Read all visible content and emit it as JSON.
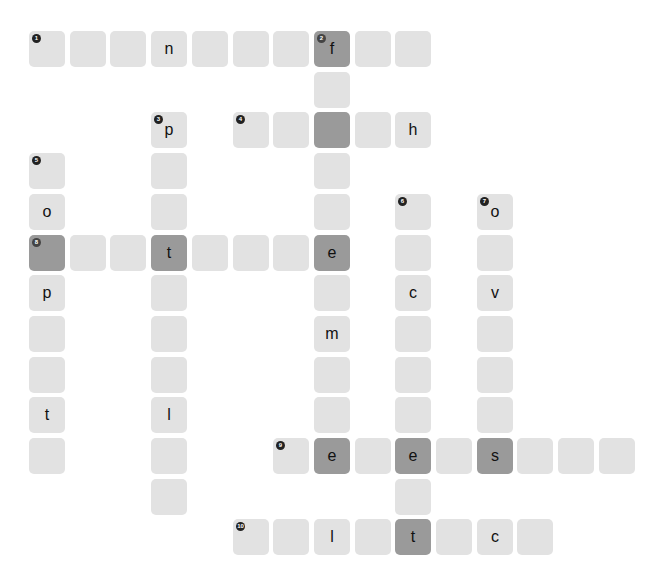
{
  "puzzle": {
    "colors": {
      "cell": "#e2e2e2",
      "highlight": "#9a9a9a",
      "number_badge": "#222222"
    },
    "grid": {
      "origin_x": 29,
      "origin_y": 31,
      "pitch": 40.7,
      "cell_size": 36
    },
    "cells": [
      {
        "r": 0,
        "c": 0,
        "num": "1",
        "letter": ""
      },
      {
        "r": 0,
        "c": 1,
        "letter": ""
      },
      {
        "r": 0,
        "c": 2,
        "letter": ""
      },
      {
        "r": 0,
        "c": 3,
        "letter": "n"
      },
      {
        "r": 0,
        "c": 4,
        "letter": ""
      },
      {
        "r": 0,
        "c": 5,
        "letter": ""
      },
      {
        "r": 0,
        "c": 6,
        "letter": ""
      },
      {
        "r": 0,
        "c": 7,
        "num": "2",
        "letter": "f",
        "dark": true
      },
      {
        "r": 0,
        "c": 8,
        "letter": ""
      },
      {
        "r": 0,
        "c": 9,
        "letter": ""
      },
      {
        "r": 1,
        "c": 7,
        "letter": ""
      },
      {
        "r": 2,
        "c": 7,
        "letter": "",
        "dark": true
      },
      {
        "r": 3,
        "c": 7,
        "letter": ""
      },
      {
        "r": 4,
        "c": 7,
        "letter": ""
      },
      {
        "r": 5,
        "c": 7,
        "letter": "e",
        "dark": true
      },
      {
        "r": 6,
        "c": 7,
        "letter": ""
      },
      {
        "r": 7,
        "c": 7,
        "letter": "m"
      },
      {
        "r": 8,
        "c": 7,
        "letter": ""
      },
      {
        "r": 9,
        "c": 7,
        "letter": ""
      },
      {
        "r": 10,
        "c": 7,
        "letter": "e",
        "dark": true
      },
      {
        "r": 2,
        "c": 5,
        "num": "4",
        "letter": ""
      },
      {
        "r": 2,
        "c": 6,
        "letter": ""
      },
      {
        "r": 2,
        "c": 8,
        "letter": ""
      },
      {
        "r": 2,
        "c": 9,
        "letter": "h"
      },
      {
        "r": 2,
        "c": 3,
        "num": "3",
        "letter": "p"
      },
      {
        "r": 3,
        "c": 3,
        "letter": ""
      },
      {
        "r": 4,
        "c": 3,
        "letter": ""
      },
      {
        "r": 5,
        "c": 3,
        "letter": "t",
        "dark": true
      },
      {
        "r": 6,
        "c": 3,
        "letter": ""
      },
      {
        "r": 7,
        "c": 3,
        "letter": ""
      },
      {
        "r": 8,
        "c": 3,
        "letter": ""
      },
      {
        "r": 9,
        "c": 3,
        "letter": "l"
      },
      {
        "r": 10,
        "c": 3,
        "letter": ""
      },
      {
        "r": 11,
        "c": 3,
        "letter": ""
      },
      {
        "r": 3,
        "c": 0,
        "num": "5",
        "letter": ""
      },
      {
        "r": 4,
        "c": 0,
        "letter": "o"
      },
      {
        "r": 5,
        "c": 0,
        "num": "8",
        "letter": "",
        "dark": true
      },
      {
        "r": 6,
        "c": 0,
        "letter": "p"
      },
      {
        "r": 7,
        "c": 0,
        "letter": ""
      },
      {
        "r": 8,
        "c": 0,
        "letter": ""
      },
      {
        "r": 9,
        "c": 0,
        "letter": "t"
      },
      {
        "r": 10,
        "c": 0,
        "letter": ""
      },
      {
        "r": 5,
        "c": 1,
        "letter": ""
      },
      {
        "r": 5,
        "c": 2,
        "letter": ""
      },
      {
        "r": 5,
        "c": 4,
        "letter": ""
      },
      {
        "r": 5,
        "c": 5,
        "letter": ""
      },
      {
        "r": 5,
        "c": 6,
        "letter": ""
      },
      {
        "r": 4,
        "c": 9,
        "num": "6",
        "letter": ""
      },
      {
        "r": 5,
        "c": 9,
        "letter": ""
      },
      {
        "r": 6,
        "c": 9,
        "letter": "c"
      },
      {
        "r": 7,
        "c": 9,
        "letter": ""
      },
      {
        "r": 8,
        "c": 9,
        "letter": ""
      },
      {
        "r": 9,
        "c": 9,
        "letter": ""
      },
      {
        "r": 10,
        "c": 9,
        "letter": "e",
        "dark": true
      },
      {
        "r": 11,
        "c": 9,
        "letter": ""
      },
      {
        "r": 4,
        "c": 11,
        "num": "7",
        "letter": "o"
      },
      {
        "r": 5,
        "c": 11,
        "letter": ""
      },
      {
        "r": 6,
        "c": 11,
        "letter": "v"
      },
      {
        "r": 7,
        "c": 11,
        "letter": ""
      },
      {
        "r": 8,
        "c": 11,
        "letter": ""
      },
      {
        "r": 9,
        "c": 11,
        "letter": ""
      },
      {
        "r": 10,
        "c": 11,
        "letter": "s",
        "dark": true
      },
      {
        "r": 10,
        "c": 6,
        "num": "9",
        "letter": ""
      },
      {
        "r": 10,
        "c": 8,
        "letter": ""
      },
      {
        "r": 10,
        "c": 10,
        "letter": ""
      },
      {
        "r": 10,
        "c": 12,
        "letter": ""
      },
      {
        "r": 10,
        "c": 13,
        "letter": ""
      },
      {
        "r": 10,
        "c": 14,
        "letter": ""
      },
      {
        "r": 12,
        "c": 5,
        "num": "10",
        "letter": ""
      },
      {
        "r": 12,
        "c": 6,
        "letter": ""
      },
      {
        "r": 12,
        "c": 7,
        "letter": "l"
      },
      {
        "r": 12,
        "c": 8,
        "letter": ""
      },
      {
        "r": 12,
        "c": 9,
        "letter": "t",
        "dark": true
      },
      {
        "r": 12,
        "c": 10,
        "letter": ""
      },
      {
        "r": 12,
        "c": 11,
        "letter": "c"
      },
      {
        "r": 12,
        "c": 12,
        "letter": ""
      }
    ]
  }
}
